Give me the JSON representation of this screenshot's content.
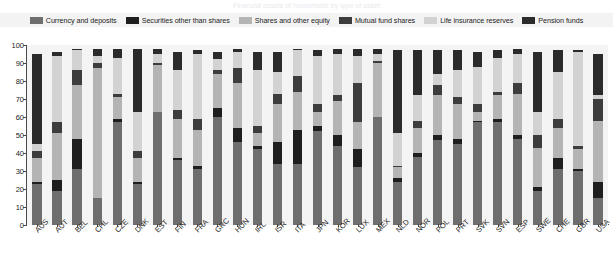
{
  "title": "Financial assets of households by type of asset",
  "legend": {
    "items": [
      {
        "label": "Currency and deposits",
        "color": "#6e6e6e",
        "key": "currency_and_deposits"
      },
      {
        "label": "Securities other than shares",
        "color": "#1f1f1f",
        "key": "securities_other_than_shares"
      },
      {
        "label": "Shares and other equity",
        "color": "#b4b4b4",
        "key": "shares_and_other_equity"
      },
      {
        "label": "Mutual fund shares",
        "color": "#3d3d3d",
        "key": "mutual_fund_shares"
      },
      {
        "label": "Life insurance reserves",
        "color": "#d2d2d2",
        "key": "life_insurance_reserves"
      },
      {
        "label": "Pension funds",
        "color": "#2b2b2b",
        "key": "pension_funds"
      }
    ]
  },
  "axes": {
    "y_ticks": [
      0,
      10,
      20,
      30,
      40,
      50,
      60,
      70,
      80,
      90,
      100
    ],
    "ylim": [
      0,
      100
    ],
    "ylabel": "",
    "xlabel": ""
  },
  "chart_data": {
    "type": "bar",
    "subtype": "stacked-vertical",
    "title": "Financial assets of households by type of asset",
    "xlabel": "",
    "ylabel": "",
    "ylim": [
      0,
      100
    ],
    "grid": false,
    "legend_position": "top",
    "categories": [
      "AUS",
      "AUT",
      "BEL",
      "CHL",
      "CZE",
      "DNK",
      "EST",
      "FIN",
      "FRA",
      "GRC",
      "HUN",
      "IRL",
      "ISR",
      "ITA",
      "JPN",
      "KOR",
      "LUX",
      "MEX",
      "NLD",
      "NOR",
      "POL",
      "PRT",
      "SVK",
      "SVN",
      "ESP",
      "SWE",
      "CHE",
      "GBR",
      "USA"
    ],
    "series": [
      {
        "name": "Currency and deposits",
        "color": "#6e6e6e",
        "values": [
          23,
          19,
          31,
          15,
          57,
          23,
          63,
          36,
          31,
          60,
          46,
          42,
          34,
          34,
          52,
          44,
          32,
          60,
          24,
          38,
          47,
          45,
          57,
          57,
          48,
          19,
          31,
          30,
          15
        ]
      },
      {
        "name": "Securities other than shares",
        "color": "#1f1f1f",
        "values": [
          1,
          6,
          17,
          0,
          2,
          1,
          0,
          1,
          2,
          5,
          8,
          2,
          12,
          19,
          3,
          6,
          10,
          0,
          2,
          2,
          3,
          3,
          1,
          2,
          2,
          2,
          6,
          1,
          9
        ]
      },
      {
        "name": "Shares and other equity",
        "color": "#b4b4b4",
        "values": [
          13,
          26,
          30,
          72,
          12,
          13,
          26,
          22,
          20,
          19,
          25,
          7,
          21,
          21,
          8,
          19,
          15,
          30,
          6,
          14,
          22,
          19,
          5,
          13,
          23,
          22,
          17,
          11,
          34
        ]
      },
      {
        "name": "Mutual fund shares",
        "color": "#3d3d3d",
        "values": [
          4,
          6,
          8,
          3,
          2,
          4,
          1,
          5,
          6,
          2,
          8,
          4,
          6,
          9,
          4,
          3,
          22,
          1,
          1,
          4,
          6,
          4,
          4,
          2,
          6,
          7,
          5,
          2,
          12
        ]
      },
      {
        "name": "Life insurance reserves",
        "color": "#d2d2d2",
        "values": [
          4,
          37,
          11,
          4,
          20,
          22,
          5,
          22,
          36,
          6,
          9,
          31,
          12,
          14,
          27,
          23,
          15,
          4,
          18,
          14,
          6,
          15,
          21,
          19,
          16,
          13,
          26,
          52,
          2
        ]
      },
      {
        "name": "Pension funds",
        "color": "#2b2b2b",
        "values": [
          50,
          2,
          1,
          4,
          5,
          35,
          3,
          10,
          2,
          4,
          2,
          10,
          11,
          1,
          3,
          3,
          4,
          3,
          46,
          25,
          13,
          11,
          8,
          4,
          3,
          33,
          12,
          1,
          23
        ]
      }
    ]
  }
}
